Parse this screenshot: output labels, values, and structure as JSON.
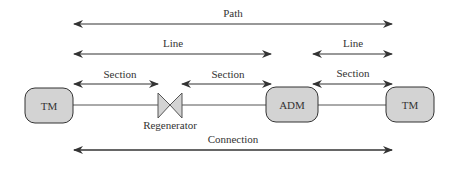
{
  "colors": {
    "stroke": "#333333",
    "node_fill": "#d3d3d3",
    "arrow": "#333333",
    "wire": "#555555"
  },
  "spans": {
    "path": {
      "label": "Path"
    },
    "line_1": {
      "label": "Line"
    },
    "line_2": {
      "label": "Line"
    },
    "section_1": {
      "label": "Section"
    },
    "section_2": {
      "label": "Section"
    },
    "section_3": {
      "label": "Section"
    },
    "connection": {
      "label": "Connection"
    }
  },
  "nodes": {
    "tm_left": {
      "label": "TM"
    },
    "regenerator": {
      "label": "Regenerator"
    },
    "adm": {
      "label": "ADM"
    },
    "tm_right": {
      "label": "TM"
    }
  }
}
